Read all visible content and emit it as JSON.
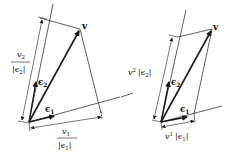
{
  "diagrams": [
    {
      "name": "contravariant-components-left",
      "vector_label": "v",
      "basis1_label": "ϵ",
      "basis1_sub": "1",
      "basis2_label": "ϵ",
      "basis2_sub": "2",
      "component2_num": "v",
      "component2_num_sub": "2",
      "component2_den": "|ϵ",
      "component2_den_sub": "2",
      "component2_den_close": "|",
      "component1_num": "v",
      "component1_num_sub": "1",
      "component1_den": "|ϵ",
      "component1_den_sub": "1",
      "component1_den_close": "|"
    },
    {
      "name": "contravariant-components-right",
      "vector_label": "v",
      "basis1_label": "ϵ",
      "basis1_sub": "1",
      "basis2_label": "ϵ",
      "basis2_sub": "2",
      "component2_v": "v",
      "component2_sup": "2",
      "component2_abs": "|ϵ",
      "component2_abs_sub": "2",
      "component2_abs_close": "|",
      "component1_v": "v",
      "component1_sup": "1",
      "component1_abs": "|ϵ",
      "component1_abs_sub": "1",
      "component1_abs_close": "|"
    }
  ],
  "colors": {
    "stroke": "#1a1a1a",
    "background": "#ffffff"
  }
}
